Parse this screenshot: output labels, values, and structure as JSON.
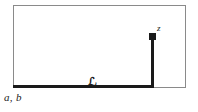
{
  "figure": {
    "kind": "contour-path-diagram",
    "background_color": "#ffffff",
    "boundary": {
      "shape": "rectangle",
      "stroke_color": "#8a8a8a",
      "stroke_width_px": 1
    },
    "path": {
      "name": "L_z",
      "stroke_color": "#1a1a1a",
      "stroke_width_px": 3,
      "description": "thick path running along the bottom edge then turning vertically upward"
    },
    "endpoint_marker": {
      "shape": "square-dot",
      "color": "#1a1a1a"
    },
    "labels": {
      "endpoint": "z",
      "path_symbol": "ℒ",
      "path_symbol_subscript": "z",
      "basepoint": "a, b"
    }
  }
}
